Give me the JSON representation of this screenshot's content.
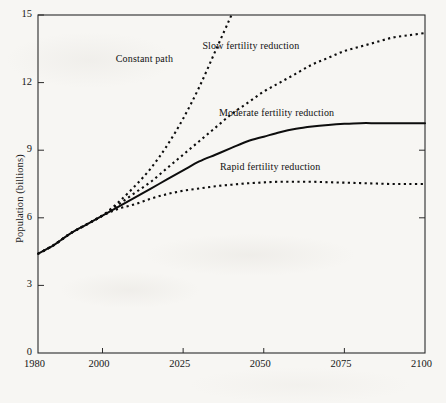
{
  "chart_data": {
    "type": "line",
    "title": "",
    "xlabel": "",
    "ylabel": "Population (billions)",
    "xlim": [
      1980,
      2100
    ],
    "ylim": [
      0,
      15
    ],
    "xticks": [
      1980,
      2000,
      2025,
      2050,
      2075,
      2100
    ],
    "xtick_labels": [
      "1980",
      "2000",
      "2025",
      "2050",
      "2075",
      "2100"
    ],
    "yticks": [
      0,
      3,
      6,
      9,
      12,
      15
    ],
    "ytick_labels": [
      "0",
      "3",
      "6",
      "9",
      "12",
      "15"
    ],
    "grid": false,
    "legend_position": "inline-annotations",
    "x": [
      1980,
      1985,
      1990,
      1995,
      2000,
      2005,
      2010,
      2015,
      2020,
      2025,
      2030,
      2035,
      2040,
      2045,
      2050,
      2055,
      2060,
      2065,
      2070,
      2075,
      2080,
      2085,
      2090,
      2095,
      2100
    ],
    "series": [
      {
        "name": "Constant path",
        "style": "dashed",
        "label_x": 2013,
        "label_y": 13.0,
        "values": [
          4.4,
          4.8,
          5.3,
          5.7,
          6.1,
          6.7,
          7.4,
          8.2,
          9.2,
          10.4,
          11.8,
          13.4,
          15.0,
          null,
          null,
          null,
          null,
          null,
          null,
          null,
          null,
          null,
          null,
          null,
          null
        ],
        "note": "exits top of plot near 2037 at 15 billion"
      },
      {
        "name": "Slow fertility reduction",
        "style": "dashed",
        "label_x": 2046,
        "label_y": 13.6,
        "values": [
          4.4,
          4.8,
          5.3,
          5.7,
          6.1,
          6.6,
          7.1,
          7.6,
          8.2,
          8.8,
          9.4,
          10.0,
          10.6,
          11.1,
          11.6,
          12.0,
          12.4,
          12.8,
          13.1,
          13.4,
          13.6,
          13.8,
          14.0,
          14.1,
          14.2
        ]
      },
      {
        "name": "Moderate fertility reduction",
        "style": "solid",
        "label_x": 2054,
        "label_y": 10.6,
        "values": [
          4.4,
          4.8,
          5.3,
          5.7,
          6.1,
          6.5,
          6.9,
          7.3,
          7.7,
          8.1,
          8.5,
          8.8,
          9.1,
          9.4,
          9.6,
          9.8,
          9.95,
          10.05,
          10.12,
          10.17,
          10.2,
          10.2,
          10.2,
          10.2,
          10.2
        ]
      },
      {
        "name": "Rapid fertility reduction",
        "style": "dashed",
        "label_x": 2052,
        "label_y": 8.2,
        "values": [
          4.4,
          4.8,
          5.3,
          5.7,
          6.1,
          6.4,
          6.6,
          6.85,
          7.05,
          7.2,
          7.3,
          7.4,
          7.47,
          7.53,
          7.57,
          7.6,
          7.6,
          7.6,
          7.58,
          7.56,
          7.54,
          7.52,
          7.5,
          7.5,
          7.5
        ]
      }
    ]
  },
  "colors": {
    "ink": "#111111",
    "page": "#f7f6f3",
    "axis": "#333333"
  }
}
